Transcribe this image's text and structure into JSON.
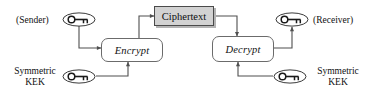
{
  "diagram": {
    "colors": {
      "ciphertext_fill": "#d2d2d2",
      "ciphertext_border": "#4a4a4a",
      "ciphertext_shadow": "#b4b4b4",
      "process_border": "#6b6b6b",
      "process_fill": "#ffffff",
      "wire": "#4f4f4f",
      "text": "#111111",
      "background": "#ffffff"
    },
    "nodes": {
      "sender_label": "(Sender)",
      "receiver_label": "(Receiver)",
      "sender_key_icon": "key-icon",
      "receiver_key_icon": "key-icon",
      "encrypt": "Encrypt",
      "decrypt": "Decrypt",
      "ciphertext": "Ciphertext",
      "kek_left_line1": "Symmetric",
      "kek_left_line2": "KEK",
      "kek_left_key_icon": "key-icon",
      "kek_right_line1": "Symmetric",
      "kek_right_line2": "KEK",
      "kek_right_key_icon": "key-icon"
    },
    "edges": [
      {
        "name": "sender-key-to-encrypt",
        "from": "sender_key",
        "to": "encrypt",
        "arrow": "right"
      },
      {
        "name": "encrypt-to-ciphertext",
        "from": "encrypt",
        "to": "ciphertext",
        "arrow": "right"
      },
      {
        "name": "ciphertext-to-decrypt",
        "from": "ciphertext",
        "to": "decrypt",
        "arrow": "down"
      },
      {
        "name": "decrypt-to-receiver-key",
        "from": "decrypt",
        "to": "receiver_key",
        "arrow": "up"
      },
      {
        "name": "kek-left-to-encrypt",
        "from": "kek_left_key",
        "to": "encrypt",
        "arrow": "up"
      },
      {
        "name": "kek-right-to-decrypt",
        "from": "kek_right_key",
        "to": "decrypt",
        "arrow": "up"
      }
    ]
  }
}
